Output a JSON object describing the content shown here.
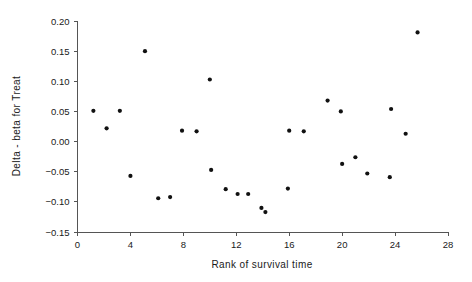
{
  "chart_data": {
    "type": "scatter",
    "title": "",
    "xlabel": "Rank of survival time",
    "ylabel": "Delta - beta for Treat",
    "xlim": [
      0,
      28
    ],
    "ylim": [
      -0.15,
      0.2
    ],
    "xticks": [
      0,
      4,
      8,
      12,
      16,
      20,
      24,
      28
    ],
    "xtick_labels": [
      "0",
      "4",
      "8",
      "12",
      "16",
      "20",
      "24",
      "28"
    ],
    "yticks": [
      -0.15,
      -0.1,
      -0.05,
      0.0,
      0.05,
      0.1,
      0.15,
      0.2
    ],
    "ytick_labels": [
      "-0.15",
      "-0.10",
      "-0.05",
      "0.00",
      "0.05",
      "0.10",
      "0.15",
      "0.20"
    ],
    "grid": false,
    "legend": "none",
    "marker": "filled-circle",
    "marker_color": "#111111",
    "points": [
      {
        "x": 1.2,
        "y": 0.051
      },
      {
        "x": 2.2,
        "y": 0.022
      },
      {
        "x": 3.2,
        "y": 0.051
      },
      {
        "x": 4.0,
        "y": -0.057
      },
      {
        "x": 5.1,
        "y": 0.15
      },
      {
        "x": 6.1,
        "y": -0.094
      },
      {
        "x": 7.0,
        "y": -0.092
      },
      {
        "x": 7.9,
        "y": 0.018
      },
      {
        "x": 9.0,
        "y": 0.017
      },
      {
        "x": 10.0,
        "y": 0.103
      },
      {
        "x": 10.1,
        "y": -0.047
      },
      {
        "x": 11.2,
        "y": -0.079
      },
      {
        "x": 12.1,
        "y": -0.087
      },
      {
        "x": 12.9,
        "y": -0.087
      },
      {
        "x": 13.9,
        "y": -0.11
      },
      {
        "x": 14.2,
        "y": -0.117
      },
      {
        "x": 15.9,
        "y": -0.078
      },
      {
        "x": 16.0,
        "y": 0.018
      },
      {
        "x": 17.1,
        "y": 0.017
      },
      {
        "x": 18.9,
        "y": 0.068
      },
      {
        "x": 19.9,
        "y": 0.05
      },
      {
        "x": 20.0,
        "y": -0.037
      },
      {
        "x": 21.0,
        "y": -0.026
      },
      {
        "x": 21.9,
        "y": -0.053
      },
      {
        "x": 23.6,
        "y": -0.059
      },
      {
        "x": 23.7,
        "y": 0.054
      },
      {
        "x": 24.8,
        "y": 0.013
      },
      {
        "x": 25.7,
        "y": 0.181
      }
    ]
  }
}
